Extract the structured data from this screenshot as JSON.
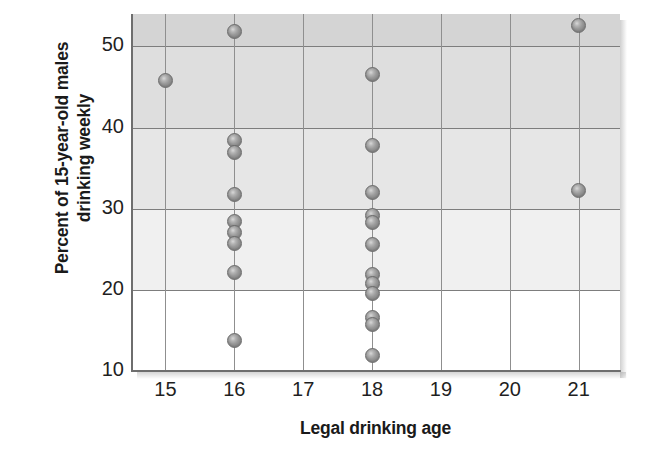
{
  "chart_data": {
    "type": "scatter",
    "title": "",
    "xlabel": "Legal drinking age",
    "ylabel_line1": "Percent of 15-year-old males",
    "ylabel_line2": "drinking weekly",
    "xlim": [
      14.5,
      21.6
    ],
    "ylim": [
      10,
      54
    ],
    "xticks": [
      15,
      16,
      17,
      18,
      19,
      20,
      21
    ],
    "yticks": [
      10,
      20,
      30,
      40,
      50
    ],
    "grid": true,
    "legend": "none",
    "marker_color": "#9a9a9a",
    "marker_edge_color": "#6a6a6a",
    "background_bands": [
      {
        "from": 10,
        "to": 20,
        "color": "#ffffff"
      },
      {
        "from": 20,
        "to": 30,
        "color": "#f0f0f0"
      },
      {
        "from": 30,
        "to": 40,
        "color": "#e6e6e6"
      },
      {
        "from": 40,
        "to": 50,
        "color": "#dedede"
      },
      {
        "from": 50,
        "to": 54,
        "color": "#d4d4d4"
      }
    ],
    "points": [
      {
        "x": 15,
        "y": 45.8
      },
      {
        "x": 16,
        "y": 51.8
      },
      {
        "x": 16,
        "y": 38.4
      },
      {
        "x": 16,
        "y": 36.9
      },
      {
        "x": 16,
        "y": 31.7
      },
      {
        "x": 16,
        "y": 28.4
      },
      {
        "x": 16,
        "y": 27.1
      },
      {
        "x": 16,
        "y": 25.7
      },
      {
        "x": 16,
        "y": 22.2
      },
      {
        "x": 16,
        "y": 13.8
      },
      {
        "x": 18,
        "y": 46.6
      },
      {
        "x": 18,
        "y": 37.8
      },
      {
        "x": 18,
        "y": 32.0
      },
      {
        "x": 18,
        "y": 29.2
      },
      {
        "x": 18,
        "y": 28.3
      },
      {
        "x": 18,
        "y": 25.6
      },
      {
        "x": 18,
        "y": 21.9
      },
      {
        "x": 18,
        "y": 20.8
      },
      {
        "x": 18,
        "y": 19.6
      },
      {
        "x": 18,
        "y": 16.6
      },
      {
        "x": 18,
        "y": 15.7
      },
      {
        "x": 18,
        "y": 11.9
      },
      {
        "x": 21,
        "y": 52.6
      },
      {
        "x": 21,
        "y": 32.2
      }
    ]
  },
  "axis": {
    "x_tick_labels": [
      "15",
      "16",
      "17",
      "18",
      "19",
      "20",
      "21"
    ],
    "y_tick_labels": [
      "10",
      "20",
      "30",
      "40",
      "50"
    ],
    "x_title": "Legal drinking age",
    "y_title_line1": "Percent of 15-year-old males",
    "y_title_line2": "drinking weekly"
  }
}
